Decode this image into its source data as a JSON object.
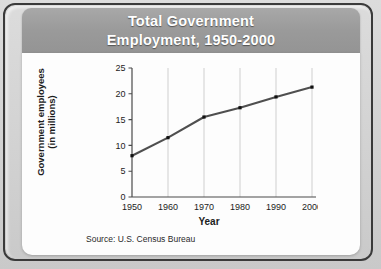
{
  "figure": {
    "title_line1": "Total Government",
    "title_line2": "Employment, 1950-2000",
    "source_label": "Source:",
    "source_text": "U.S. Census Bureau",
    "banner_color": "#9a9a9a",
    "title_color": "#ffffff",
    "card_color": "#fdfdfd",
    "frame_color": "#3a3a3a",
    "background_color": "#d2d2d2"
  },
  "chart_data": {
    "type": "line",
    "title": "Total Government Employment, 1950-2000",
    "xlabel": "Year",
    "ylabel": "Government employees (in millions)",
    "ylabel_line1": "Government employees",
    "ylabel_line2": "(in millions)",
    "x": [
      1950,
      1960,
      1970,
      1980,
      1990,
      2000
    ],
    "values": [
      8.0,
      11.5,
      15.5,
      17.3,
      19.4,
      21.3
    ],
    "xtick_labels": [
      "1950",
      "1960",
      "1970",
      "1980",
      "1990",
      "2000"
    ],
    "ytick_labels": [
      "0",
      "5",
      "10",
      "15",
      "20",
      "25"
    ],
    "yticks": [
      0,
      5,
      10,
      15,
      20,
      25
    ],
    "xlim": [
      1950,
      2000
    ],
    "ylim": [
      0,
      25
    ],
    "grid": "vertical",
    "gridline_color": "#c9c9c9",
    "line_color": "#4f4f4f",
    "marker_color": "#111111",
    "legend": "none",
    "source": "Source: U.S. Census Bureau"
  }
}
